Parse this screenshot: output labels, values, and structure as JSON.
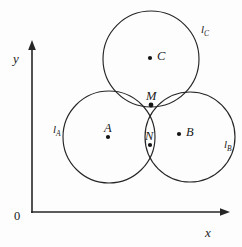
{
  "figure": {
    "background_color": "#fdfdfd",
    "stroke_color": "#262626"
  },
  "axes": {
    "x_label": "x",
    "y_label": "y",
    "origin_label": "0",
    "x_axis_name": "x-axis",
    "y_axis_name": "y-axis"
  },
  "circles": [
    {
      "id": "circle-a",
      "label": "l",
      "subscript": "A",
      "center_label": "A",
      "cx": 109,
      "cy": 137,
      "r": 46
    },
    {
      "id": "circle-b",
      "label": "l",
      "subscript": "B",
      "center_label": "B",
      "cx": 190,
      "cy": 137,
      "r": 45
    },
    {
      "id": "circle-c",
      "label": "l",
      "subscript": "C",
      "center_label": "C",
      "cx": 151,
      "cy": 59,
      "r": 48
    }
  ],
  "points": [
    {
      "id": "point-a",
      "label": "A",
      "x": 108,
      "y": 137
    },
    {
      "id": "point-b",
      "label": "B",
      "x": 179,
      "y": 134
    },
    {
      "id": "point-c",
      "label": "C",
      "x": 150,
      "y": 58
    },
    {
      "id": "point-m",
      "label": "M",
      "x": 151,
      "y": 105
    },
    {
      "id": "point-n",
      "label": "N",
      "x": 150,
      "y": 145
    }
  ]
}
